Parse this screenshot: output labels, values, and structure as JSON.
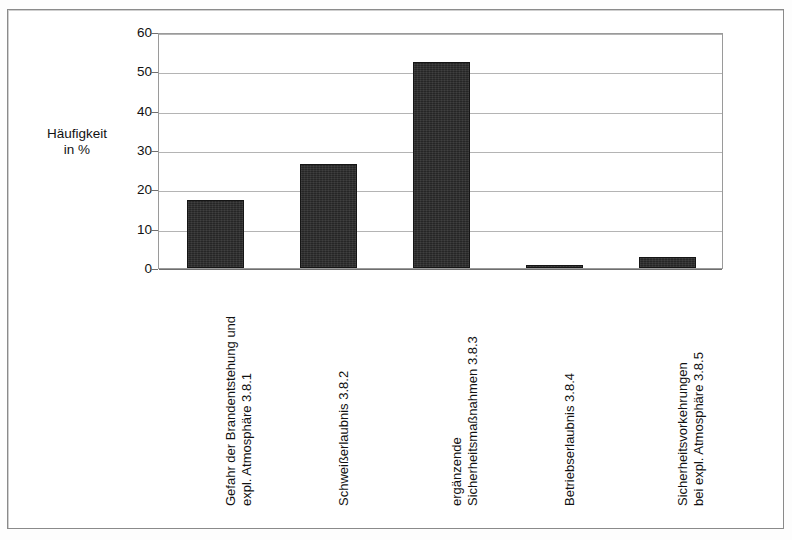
{
  "axis_caption": {
    "line1": "Häufigkeit",
    "line2": "in %"
  },
  "chart_data": {
    "type": "bar",
    "title": "",
    "xlabel": "",
    "ylabel": "Häufigkeit in %",
    "ylim": [
      0,
      60
    ],
    "ytick_labels": [
      "60",
      "50",
      "40",
      "30",
      "20",
      "10",
      "0"
    ],
    "yticks": [
      60,
      50,
      40,
      30,
      20,
      10,
      0
    ],
    "grid": true,
    "legend": "none",
    "bar_color": "#262626",
    "categories": [
      "Gefahr der Brandentstehung und expl. Atmosphäre 3.8.1",
      "Schweißerlaubnis 3.8.2",
      "ergänzende Sicherheitsmaßnahmen 3.8.3",
      "Betriebserlaubnis 3.8.4",
      "Sicherheitsvorkehrungen bei expl. Atmosphäre 3.8.5"
    ],
    "category_lines": [
      [
        "Gefahr der Brandentstehung und",
        "expl. Atmosphäre 3.8.1"
      ],
      [
        "Schweißerlaubnis 3.8.2",
        ""
      ],
      [
        "ergänzende",
        "Sicherheitsmaßnahmen 3.8.3"
      ],
      [
        "Betriebserlaubnis 3.8.4",
        ""
      ],
      [
        "Sicherheitsvorkehrungen",
        "bei expl. Atmosphäre 3.8.5"
      ]
    ],
    "values": [
      17.4,
      26.4,
      52.4,
      0.3,
      2.8
    ]
  }
}
